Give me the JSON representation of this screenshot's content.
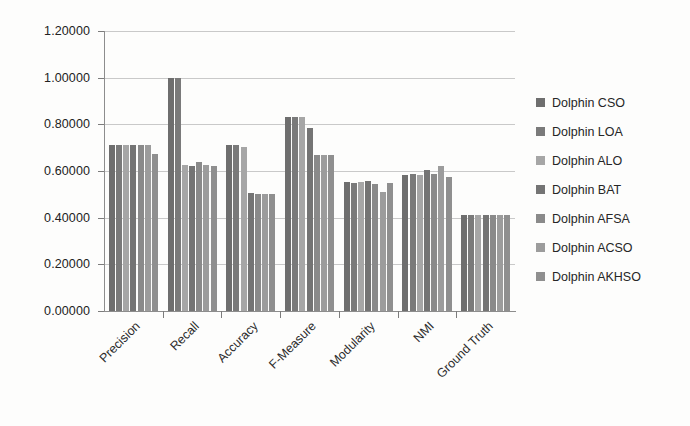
{
  "chart_data": {
    "type": "bar",
    "title": "",
    "subtitle": "",
    "xlabel": "",
    "ylabel": "",
    "ylim": [
      0,
      1.2
    ],
    "ytick_step": 0.2,
    "grid": true,
    "legend_position": "right",
    "ytick_labels": [
      "1.20000",
      "1.00000",
      "0.80000",
      "0.60000",
      "0.40000",
      "0.20000",
      "0.00000"
    ],
    "ytick_values": [
      1.2,
      1.0,
      0.8,
      0.6,
      0.4,
      0.2,
      0.0
    ],
    "categories": [
      "Precision",
      "Recall",
      "Accuracy",
      "F-Measure",
      "Modularity",
      "NMI",
      "Ground Truth"
    ],
    "series": [
      {
        "name": "Dolphin CSO",
        "color": "#6e6e6e",
        "values": [
          0.71,
          1.0,
          0.71,
          0.83,
          0.551,
          0.585,
          0.41
        ]
      },
      {
        "name": "Dolphin LOA",
        "color": "#7a7a7a",
        "values": [
          0.71,
          1.0,
          0.71,
          0.83,
          0.548,
          0.586,
          0.41
        ]
      },
      {
        "name": "Dolphin ALO",
        "color": "#a6a6a6",
        "values": [
          0.712,
          0.625,
          0.705,
          0.83,
          0.552,
          0.584,
          0.412
        ]
      },
      {
        "name": "Dolphin BAT",
        "color": "#747474",
        "values": [
          0.712,
          0.622,
          0.505,
          0.783,
          0.556,
          0.605,
          0.412
        ]
      },
      {
        "name": "Dolphin AFSA",
        "color": "#8a8a8a",
        "values": [
          0.712,
          0.64,
          0.502,
          0.667,
          0.545,
          0.588,
          0.412
        ]
      },
      {
        "name": "Dolphin ACSO",
        "color": "#9c9c9c",
        "values": [
          0.712,
          0.625,
          0.5,
          0.667,
          0.512,
          0.622,
          0.412
        ]
      },
      {
        "name": "Dolphin AKHSO",
        "color": "#8f8f8f",
        "values": [
          0.675,
          0.622,
          0.5,
          0.667,
          0.55,
          0.575,
          0.412
        ]
      }
    ]
  }
}
